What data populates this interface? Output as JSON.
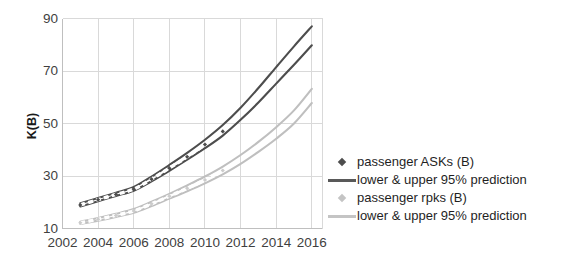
{
  "chart_data": {
    "type": "line",
    "title": "",
    "xlabel": "",
    "ylabel": "K(B)",
    "xlim": [
      2002,
      2016.6
    ],
    "ylim": [
      10,
      90
    ],
    "grid": true,
    "legend_position": "right",
    "x_ticks": [
      "2002",
      "2004",
      "2006",
      "2008",
      "2010",
      "2012",
      "2014",
      "2016"
    ],
    "x_tick_values": [
      2002,
      2004,
      2006,
      2008,
      2010,
      2012,
      2014,
      2016
    ],
    "y_ticks": [
      "10",
      "30",
      "50",
      "70",
      "90"
    ],
    "y_tick_values": [
      10,
      30,
      50,
      70,
      90
    ],
    "x": [
      2003,
      2004,
      2005,
      2006,
      2007,
      2008,
      2009,
      2010,
      2011,
      2012,
      2013,
      2014,
      2015,
      2016
    ],
    "series": [
      {
        "name": "passenger ASKs (B) upper 95% prediction",
        "key": "asks_upper",
        "color": "#4d4d4d",
        "style": "solid",
        "values": [
          19.6,
          21.6,
          23.6,
          25.8,
          29.8,
          34.2,
          38.8,
          43.8,
          49.4,
          56.0,
          63.5,
          71.5,
          79.4,
          87.0
        ]
      },
      {
        "name": "passenger ASKs (B)",
        "key": "asks_actual",
        "color": "#4d4d4d",
        "style": "dashed-markers",
        "marker": "diamond",
        "values": [
          19.0,
          21.0,
          23.0,
          25.0,
          28.8,
          33.0,
          37.3,
          42.0,
          47.0,
          null,
          null,
          null,
          null,
          null
        ]
      },
      {
        "name": "passenger ASKs (B) lower 95% prediction",
        "key": "asks_lower",
        "color": "#4d4d4d",
        "style": "solid",
        "values": [
          18.4,
          20.4,
          22.4,
          24.4,
          28.0,
          32.0,
          36.2,
          40.6,
          45.4,
          51.4,
          58.0,
          65.2,
          72.4,
          79.8
        ]
      },
      {
        "name": "passenger rpks (B) upper 95% prediction",
        "key": "rpks_upper",
        "color": "#bfbfbf",
        "style": "solid",
        "values": [
          12.6,
          14.0,
          15.6,
          17.4,
          20.2,
          23.2,
          26.4,
          29.8,
          33.6,
          38.0,
          43.0,
          48.6,
          55.0,
          63.2
        ]
      },
      {
        "name": "passenger rpks (B)",
        "key": "rpks_actual",
        "color": "#cccccc",
        "style": "dashed-markers",
        "marker": "diamond",
        "values": [
          12.2,
          13.5,
          15.0,
          16.7,
          19.4,
          22.3,
          25.3,
          28.5,
          32.1,
          null,
          null,
          null,
          null,
          null
        ]
      },
      {
        "name": "passenger rpks (B) lower 95% prediction",
        "key": "rpks_lower",
        "color": "#bfbfbf",
        "style": "solid",
        "values": [
          11.8,
          13.0,
          14.4,
          16.0,
          18.6,
          21.4,
          24.2,
          27.2,
          30.6,
          34.6,
          39.2,
          44.2,
          50.0,
          57.8
        ]
      }
    ],
    "legend": [
      {
        "label": "passenger ASKs (B)",
        "key_type": "diamond",
        "color": "#4d4d4d"
      },
      {
        "label": "lower & upper 95% prediction",
        "key_type": "line",
        "color": "#595959"
      },
      {
        "label": "passenger rpks (B)",
        "key_type": "diamond",
        "color": "#c4c4c4"
      },
      {
        "label": "lower & upper 95% prediction",
        "key_type": "line",
        "color": "#c4c4c4"
      }
    ],
    "colors": {
      "asks": "#4d4d4d",
      "rpks": "#bfbfbf",
      "grid": "#d9d9d9",
      "axis": "#bfbfbf",
      "text": "#3f3f3f",
      "background": "#ffffff"
    }
  }
}
